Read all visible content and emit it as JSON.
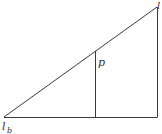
{
  "diagram": {
    "title": "",
    "line_color": "#3a3a3a",
    "labels": {
      "apex": "l",
      "interior": "p",
      "base_main": "l",
      "base_sub": "b"
    }
  }
}
